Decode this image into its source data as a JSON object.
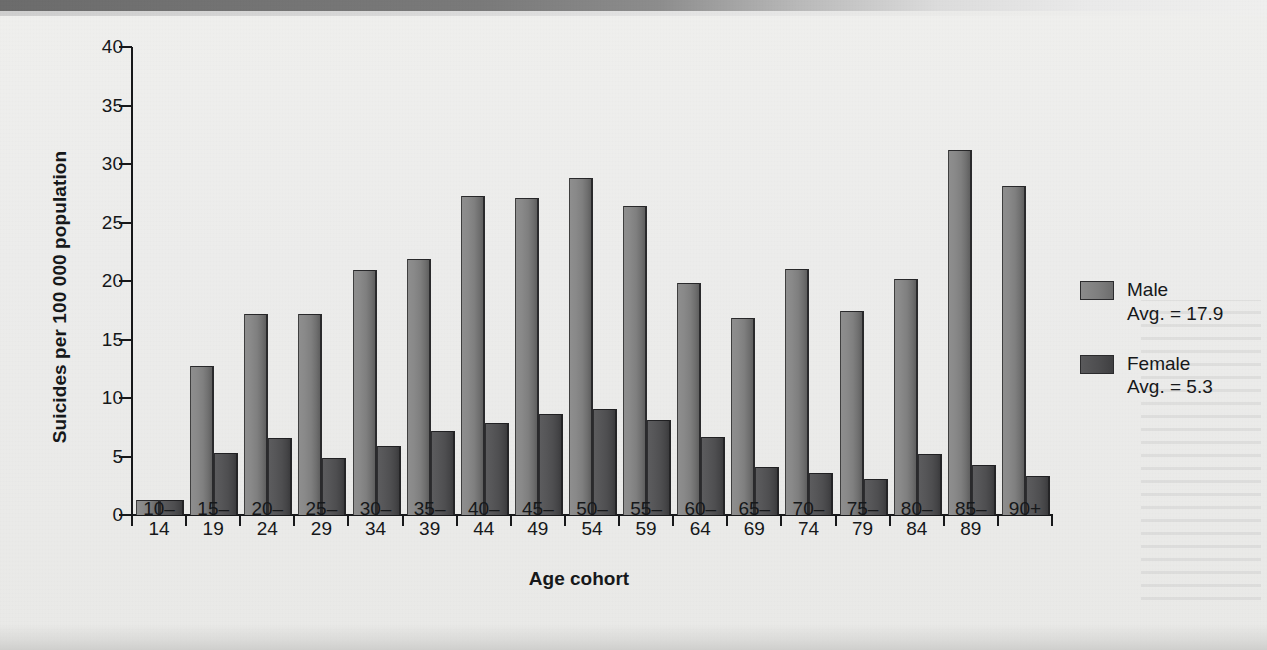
{
  "figure": {
    "y_axis_title": "Suicides per 100 000 population",
    "x_axis_title": "Age cohort"
  },
  "legend": {
    "entries": [
      {
        "name": "Male",
        "avg_label": "Avg. = 17.9",
        "swatch": "male-swatch",
        "color": "#7e7e7e"
      },
      {
        "name": "Female",
        "avg_label": "Avg. = 5.3",
        "swatch": "female-swatch",
        "color": "#4d4d4f"
      }
    ]
  },
  "chart_data": {
    "type": "bar",
    "title": "",
    "xlabel": "Age cohort",
    "ylabel": "Suicides per 100 000 population",
    "ylim": [
      0,
      40
    ],
    "yticks": [
      0,
      5,
      10,
      15,
      20,
      25,
      30,
      35,
      40
    ],
    "ytick_labels": [
      "0",
      "5",
      "10",
      "15",
      "20",
      "25",
      "30",
      "35",
      "40"
    ],
    "grid": false,
    "legend_position": "right",
    "categories": [
      "10–14",
      "15–19",
      "20–24",
      "25–29",
      "30–34",
      "35–39",
      "40–44",
      "45–49",
      "50–54",
      "55–59",
      "60–64",
      "65–69",
      "70–74",
      "75–79",
      "80–84",
      "85–89",
      "90+"
    ],
    "category_lines": [
      [
        "10–",
        "14"
      ],
      [
        "15–",
        "19"
      ],
      [
        "20–",
        "24"
      ],
      [
        "25–",
        "29"
      ],
      [
        "30–",
        "34"
      ],
      [
        "35–",
        "39"
      ],
      [
        "40–",
        "44"
      ],
      [
        "45–",
        "49"
      ],
      [
        "50–",
        "54"
      ],
      [
        "55–",
        "59"
      ],
      [
        "60–",
        "64"
      ],
      [
        "65–",
        "69"
      ],
      [
        "70–",
        "74"
      ],
      [
        "75–",
        "79"
      ],
      [
        "80–",
        "84"
      ],
      [
        "85–",
        "89"
      ],
      [
        "90+",
        ""
      ]
    ],
    "series": [
      {
        "name": "Male",
        "average": 17.9,
        "color": "#7e7e7e",
        "values": [
          1.3,
          12.7,
          17.2,
          17.2,
          20.9,
          21.9,
          27.3,
          27.1,
          28.8,
          26.4,
          19.8,
          16.8,
          21.0,
          17.4,
          20.2,
          31.2,
          28.1
        ]
      },
      {
        "name": "Female",
        "average": 5.3,
        "color": "#4d4d4f",
        "values": [
          1.3,
          5.3,
          6.6,
          4.9,
          5.9,
          7.2,
          7.9,
          8.6,
          9.1,
          8.1,
          6.7,
          4.1,
          3.6,
          3.1,
          5.2,
          4.3,
          3.3
        ]
      }
    ]
  }
}
